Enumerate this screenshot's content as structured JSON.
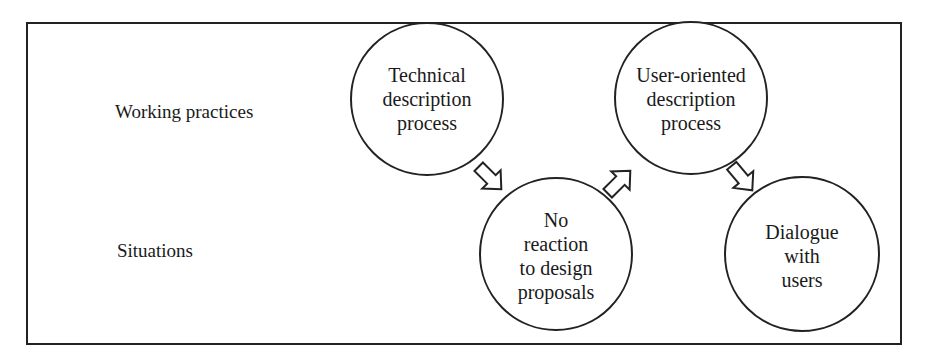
{
  "diagram": {
    "rows": [
      {
        "id": "working_practices",
        "label": "Working practices"
      },
      {
        "id": "situations",
        "label": "Situations"
      }
    ],
    "nodes": [
      {
        "id": "technical",
        "row": "working_practices",
        "lines": [
          "Technical",
          "description",
          "process"
        ],
        "cx": 427,
        "cy": 99,
        "r": 76
      },
      {
        "id": "no_reaction",
        "row": "situations",
        "lines": [
          "No",
          "reaction",
          "to design",
          "proposals"
        ],
        "cx": 556,
        "cy": 254,
        "r": 76
      },
      {
        "id": "user_oriented",
        "row": "working_practices",
        "lines": [
          "User-oriented",
          "description",
          "process"
        ],
        "cx": 691,
        "cy": 98,
        "r": 76
      },
      {
        "id": "dialogue",
        "row": "situations",
        "lines": [
          "Dialogue",
          "with",
          "users"
        ],
        "cx": 802,
        "cy": 254,
        "r": 77
      }
    ],
    "edges": [
      {
        "from": "technical",
        "to": "no_reaction",
        "style": "hollow-block-arrow"
      },
      {
        "from": "no_reaction",
        "to": "user_oriented",
        "style": "hollow-block-arrow"
      },
      {
        "from": "user_oriented",
        "to": "dialogue",
        "style": "hollow-block-arrow"
      }
    ],
    "colors": {
      "stroke": "#222222",
      "background": "#ffffff",
      "text": "#1a1a1a"
    }
  }
}
